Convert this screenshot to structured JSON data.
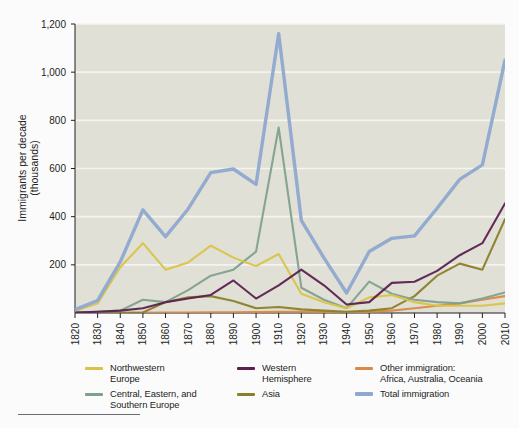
{
  "chart_data": {
    "type": "line",
    "title": "",
    "xlabel": "",
    "ylabel": "Immigrants per decade\n(thousands)",
    "ylabel_line1": "Immigrants per decade",
    "ylabel_line2": "(thousands)",
    "xlim": [
      1820,
      2010
    ],
    "ylim": [
      0,
      1200
    ],
    "ytick_values": [
      200,
      400,
      600,
      800,
      1000,
      1200
    ],
    "ytick_labels": [
      "200",
      "400",
      "600",
      "800",
      "1,000",
      "1,200"
    ],
    "grid": "horizontal",
    "legend_position": "below",
    "x": [
      1820,
      1830,
      1840,
      1850,
      1860,
      1870,
      1880,
      1890,
      1900,
      1910,
      1920,
      1930,
      1940,
      1950,
      1960,
      1970,
      1980,
      1990,
      2000,
      2010
    ],
    "xtick_labels": [
      "1820",
      "1830",
      "1840",
      "1850",
      "1860",
      "1870",
      "1880",
      "1890",
      "1900",
      "1910",
      "1920",
      "1930",
      "1940",
      "1950",
      "1960",
      "1970",
      "1980",
      "1990",
      "2000",
      "2010"
    ],
    "series": [
      {
        "name": "Northwestern Europe",
        "color": "#d9c347",
        "values": [
          8,
          40,
          190,
          290,
          180,
          210,
          280,
          230,
          195,
          245,
          80,
          45,
          20,
          65,
          75,
          45,
          30,
          30,
          30,
          40
        ]
      },
      {
        "name": "Central, Eastern, and Southern Europe",
        "color": "#7fa08d",
        "values": [
          2,
          5,
          10,
          55,
          45,
          95,
          155,
          180,
          255,
          770,
          105,
          55,
          20,
          130,
          80,
          55,
          45,
          40,
          60,
          85
        ]
      },
      {
        "name": "Western Hemisphere",
        "color": "#5b2150",
        "values": [
          2,
          5,
          10,
          20,
          45,
          60,
          75,
          135,
          60,
          115,
          180,
          115,
          35,
          45,
          125,
          130,
          175,
          240,
          290,
          455
        ]
      },
      {
        "name": "Asia",
        "color": "#8a8029",
        "values": [
          1,
          1,
          1,
          2,
          45,
          65,
          70,
          50,
          20,
          25,
          15,
          10,
          5,
          10,
          20,
          70,
          155,
          205,
          180,
          390
        ]
      },
      {
        "name": "Other immigration: Africa, Australia, Oceania",
        "color": "#d98a43",
        "values": [
          1,
          1,
          1,
          1,
          2,
          2,
          3,
          3,
          4,
          5,
          5,
          4,
          3,
          5,
          10,
          20,
          30,
          40,
          55,
          70
        ]
      },
      {
        "name": "Total immigration",
        "color": "#8ea8ce",
        "values": [
          14,
          52,
          212,
          428,
          317,
          432,
          583,
          598,
          534,
          1160,
          385,
          229,
          83,
          255,
          310,
          320,
          435,
          555,
          615,
          1050
        ]
      }
    ]
  },
  "axis": {
    "y_label_line1": "Immigrants per decade",
    "y_label_line2": "(thousands)"
  },
  "legend": {
    "columns": [
      {
        "entries": [
          {
            "label": "Northwestern\nEurope",
            "color": "#d9c347",
            "thick": false
          },
          {
            "label": "Central, Eastern, and\nSouthern Europe",
            "color": "#7fa08d",
            "thick": false
          }
        ]
      },
      {
        "entries": [
          {
            "label": "Western\nHemisphere",
            "color": "#5b2150",
            "thick": false
          },
          {
            "label": "Asia",
            "color": "#8a8029",
            "thick": false
          }
        ]
      },
      {
        "entries": [
          {
            "label": "Other immigration:\nAfrica, Australia, Oceania",
            "color": "#d98a43",
            "thick": false
          },
          {
            "label": "Total immigration",
            "color": "#8ea8ce",
            "thick": true
          }
        ]
      }
    ]
  },
  "colors": {
    "page_background": "#fbfbfc",
    "plot_background": "#e0dfd6",
    "gridline": "#f4f3ee",
    "axis": "#231f20",
    "footer_rule": "#6e6e72"
  }
}
